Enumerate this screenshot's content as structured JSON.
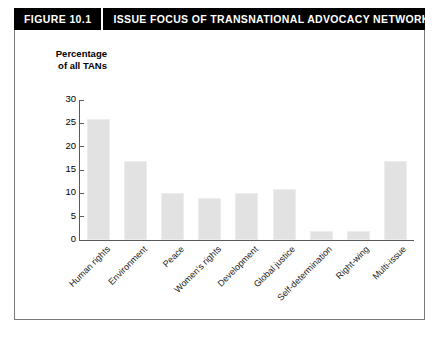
{
  "header": {
    "figure_number": "FIGURE 10.1",
    "title": "ISSUE FOCUS OF TRANSNATIONAL ADVOCACY NETWORKS, 2000"
  },
  "axis_caption_line1": "Percentage",
  "axis_caption_line2": "of all TANs",
  "chart_data": {
    "type": "bar",
    "title": "ISSUE FOCUS OF TRANSNATIONAL ADVOCACY NETWORKS, 2000",
    "xlabel": "",
    "ylabel": "Percentage of all TANs",
    "ylim": [
      0,
      30
    ],
    "yticks": [
      0,
      5,
      10,
      15,
      20,
      25,
      30
    ],
    "grid": false,
    "legend": false,
    "bar_color": "#e2e2e2",
    "categories": [
      "Human rights",
      "Environment",
      "Peace",
      "Women's rights",
      "Development",
      "Global justice",
      "Self-determination",
      "Right-wing",
      "Multi-issue"
    ],
    "values": [
      26,
      17,
      10,
      9,
      10,
      11,
      2,
      2,
      17
    ]
  }
}
